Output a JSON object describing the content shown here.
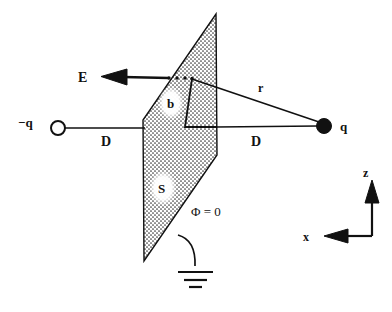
{
  "figure": {
    "background_color": "#ffffff",
    "ink_color": "#111111",
    "width": 392,
    "height": 312
  },
  "charges": {
    "negative": {
      "label": "−q",
      "marker": "open-circle",
      "fill": "#ffffff",
      "cx": 58,
      "cy": 128,
      "r": 7
    },
    "positive": {
      "label": "q",
      "marker": "filled-circle",
      "fill": "#111111",
      "cx": 324,
      "cy": 126,
      "r": 7.5
    }
  },
  "distances": {
    "left_label": "D",
    "right_label": "D",
    "radius_label": "r"
  },
  "field": {
    "label": "E",
    "arrow_direction": "left",
    "dotted_segment_dots": 4
  },
  "plane": {
    "patch_label": "b",
    "surface_label": "S",
    "potential_label": "Φ = 0",
    "fill_pattern": "stipple-dots",
    "pattern_color": "#3a3a3a"
  },
  "ground": {
    "symbol": "earth-ground",
    "bar_count": 3
  },
  "axes": {
    "vertical_label": "z",
    "horizontal_label": "x",
    "origin": {
      "x": 372,
      "y": 236
    }
  }
}
